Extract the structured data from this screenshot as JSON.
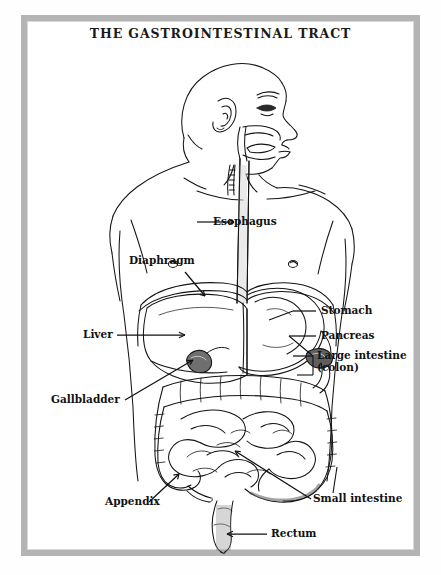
{
  "figure": {
    "title": "THE GASTROINTESTINAL TRACT",
    "style": "black-and-white-line-drawing"
  },
  "frame": {
    "border_color": "#b4b4b4",
    "background_color": "#ffffff"
  },
  "colors": {
    "ink": "#111111",
    "page": "#ffffff",
    "frame": "#b4b4b4",
    "shade": "#808080"
  },
  "labels": {
    "esophagus": "Esophagus",
    "diaphragm": "Diaphragm",
    "liver": "Liver",
    "gallbladder": "Gallbladder",
    "appendix": "Appendix",
    "stomach": "Stomach",
    "pancreas": "Pancreas",
    "large_intestine": "Large intestine",
    "large_intestine_sub": "(colon)",
    "small_intestine": "Small intestine",
    "rectum": "Rectum"
  },
  "anatomy_parts": [
    "head-profile",
    "ear",
    "eye",
    "nose",
    "lips",
    "mouth-cavity",
    "tongue",
    "trachea",
    "esophagus",
    "shoulders",
    "clavicles",
    "chest",
    "nipples",
    "diaphragm",
    "liver",
    "gallbladder",
    "stomach",
    "pancreas",
    "duodenum",
    "transverse-colon",
    "ascending-colon",
    "descending-colon",
    "small-intestine",
    "cecum",
    "appendix",
    "sigmoid-colon",
    "rectum",
    "torso-outline"
  ]
}
